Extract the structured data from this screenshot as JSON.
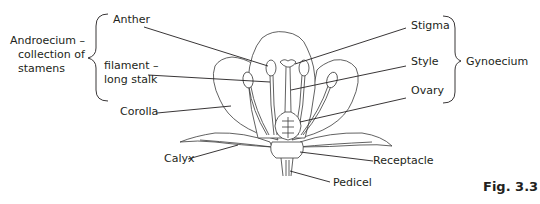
{
  "figure": {
    "caption": "Fig. 3.3"
  },
  "groups": {
    "androecium": "Androecium –",
    "androecium_line2": "collection of",
    "androecium_line3": "stamens",
    "gynoecium": "Gynoecium"
  },
  "labels": {
    "anther": "Anther",
    "filament": "filament –",
    "filament_line2": "long stalk",
    "corolla": "Corolla",
    "calyx": "Calyx",
    "stigma": "Stigma",
    "style": "Style",
    "ovary": "Ovary",
    "receptacle": "Receptacle",
    "pedicel": "Pedicel"
  }
}
